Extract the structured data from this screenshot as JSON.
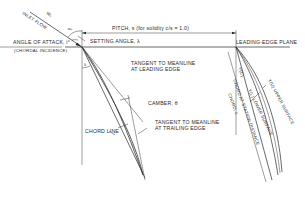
{
  "diagram": {
    "labels": {
      "inlet_flow": "INLET FLOW",
      "w1": "W₁",
      "alpha1": "α₁",
      "angle_of_attack": "ANGLE OF ATTACK, i°",
      "chordal_incidence": "(CHORDAL INCIDENCE)",
      "setting_angle": "SETTING ANGLE, λ",
      "pitch": "PITCH, s (for solidity  c/s = 1.0)",
      "leading_edge_plane": "LEADING-EDGE PLANE",
      "lambda": "λ",
      "tangent_leading": "TANGENT TO MEANLINE",
      "tangent_leading_2": "AT LEADING EDGE",
      "camber": "CAMBER, θ",
      "tangent_trailing": "TANGENT TO MEANLINE",
      "tangent_trailing_2": "AT TRAILING EDGE",
      "chord_line": "CHORD LINE",
      "yc": "Y(C)",
      "chord_station": "CHORD AT STATION DISTANCE",
      "chord_c": "CHORD, c",
      "yl_lower": "Y(L) LOWER SURFACE",
      "yu_upper": "Y(U) UPPER SURFACE"
    }
  }
}
